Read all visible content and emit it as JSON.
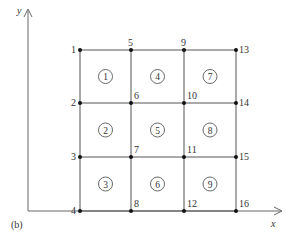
{
  "figure": {
    "label": "(b)",
    "axes": {
      "x_label": "x",
      "y_label": "y"
    },
    "grid": {
      "columns": 4,
      "rows": 4
    },
    "nodes": [
      {
        "id": "1",
        "col": 0,
        "row": 0
      },
      {
        "id": "2",
        "col": 0,
        "row": 1
      },
      {
        "id": "3",
        "col": 0,
        "row": 2
      },
      {
        "id": "4",
        "col": 0,
        "row": 3
      },
      {
        "id": "5",
        "col": 1,
        "row": 0
      },
      {
        "id": "6",
        "col": 1,
        "row": 1
      },
      {
        "id": "7",
        "col": 1,
        "row": 2
      },
      {
        "id": "8",
        "col": 1,
        "row": 3
      },
      {
        "id": "9",
        "col": 2,
        "row": 0
      },
      {
        "id": "10",
        "col": 2,
        "row": 1
      },
      {
        "id": "11",
        "col": 2,
        "row": 2
      },
      {
        "id": "12",
        "col": 2,
        "row": 3
      },
      {
        "id": "13",
        "col": 3,
        "row": 0
      },
      {
        "id": "14",
        "col": 3,
        "row": 1
      },
      {
        "id": "15",
        "col": 3,
        "row": 2
      },
      {
        "id": "16",
        "col": 3,
        "row": 3
      }
    ],
    "elements": [
      {
        "id": "1",
        "col": 0,
        "row": 0
      },
      {
        "id": "2",
        "col": 0,
        "row": 1
      },
      {
        "id": "3",
        "col": 0,
        "row": 2
      },
      {
        "id": "4",
        "col": 1,
        "row": 0
      },
      {
        "id": "5",
        "col": 1,
        "row": 1
      },
      {
        "id": "6",
        "col": 1,
        "row": 2
      },
      {
        "id": "7",
        "col": 2,
        "row": 0
      },
      {
        "id": "8",
        "col": 2,
        "row": 1
      },
      {
        "id": "9",
        "col": 2,
        "row": 2
      }
    ],
    "colors": {
      "line": "#555555",
      "node": "#111111",
      "text": "#333333"
    }
  }
}
